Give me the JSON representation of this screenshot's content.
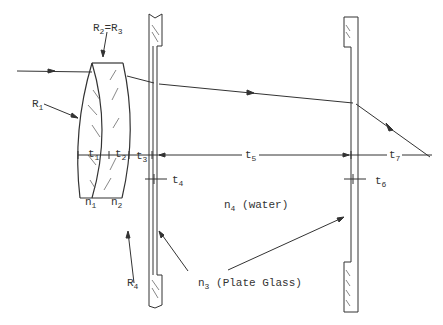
{
  "diagram": {
    "type": "optical ray diagram",
    "labels": {
      "r23": {
        "base": "R",
        "sub1": "2",
        "eq": "=R",
        "sub2": "3"
      },
      "r1": {
        "base": "R",
        "sub": "1"
      },
      "r4": {
        "base": "R",
        "sub": "4"
      },
      "t1": {
        "base": "t",
        "sub": "1"
      },
      "t2": {
        "base": "t",
        "sub": "2"
      },
      "t3": {
        "base": "t",
        "sub": "3"
      },
      "t4": {
        "base": "t",
        "sub": "4"
      },
      "t5": {
        "base": "t",
        "sub": "5"
      },
      "t6": {
        "base": "t",
        "sub": "6"
      },
      "t7": {
        "base": "t",
        "sub": "7"
      },
      "n1": {
        "base": "n",
        "sub": "1"
      },
      "n2": {
        "base": "n",
        "sub": "2"
      },
      "n4": {
        "base": "n",
        "sub": "4",
        "note": "(water)"
      },
      "n3": {
        "base": "n",
        "sub": "3",
        "note": "(Plate Glass)"
      }
    },
    "colors": {
      "line": "#333333",
      "background": "#ffffff"
    }
  }
}
